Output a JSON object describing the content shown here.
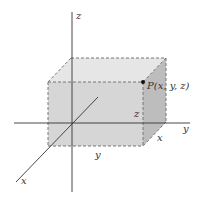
{
  "diagram": {
    "axes": {
      "x_label": "x",
      "y_label": "y",
      "z_label": "z"
    },
    "point": {
      "label": "P(x, y, z)"
    },
    "dimension_labels": {
      "front_bottom": "y",
      "right_bottom": "x",
      "right_vertical": "z"
    },
    "colors": {
      "front_face": "#d6d6d6",
      "top_face": "#e6e6e6",
      "right_face": "#bdbdbd",
      "axis": "#333333",
      "dashed_edge": "#777777",
      "point": "#111111"
    }
  }
}
